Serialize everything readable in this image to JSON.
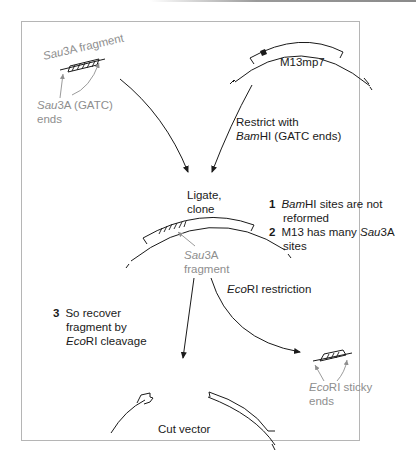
{
  "diagram": {
    "sau3a_fragment": {
      "label": "Sau3A fragment",
      "label_italic": "Sau",
      "label_rest": "3A fragment",
      "ends_label_italic": "Sau",
      "ends_label_rest": "3A (GATC)",
      "ends_label_line2": "ends"
    },
    "vector": {
      "label": "M13mp7"
    },
    "restrict_step": {
      "line1": "Restrict with",
      "line2_italic": "Bam",
      "line2_rest": "HI (GATC ends)"
    },
    "ligate_step": {
      "line1": "Ligate,",
      "line2": "clone"
    },
    "notes": [
      {
        "number": "1",
        "italic": "Bam",
        "text": "HI sites are not",
        "line2": "reformed"
      },
      {
        "number": "2",
        "text": "M13 has many ",
        "italic": "Sau",
        "text_after": "3A",
        "line2": "sites"
      },
      {
        "number": "3",
        "text": "So recover",
        "line2": "fragment by",
        "line3_italic": "Eco",
        "line3_rest": "RI cleavage"
      }
    ],
    "recombinant_fragment": {
      "italic": "Sau",
      "rest": "3A",
      "line2": "fragment"
    },
    "ecori_step": {
      "italic": "Eco",
      "rest": "RI restriction"
    },
    "sticky_ends": {
      "italic": "Eco",
      "rest": "RI sticky",
      "line2": "ends"
    },
    "cut_vector": {
      "label": "Cut vector"
    }
  },
  "colors": {
    "line": "#1a1a1a",
    "grey_label": "#8e8e8e",
    "frame": "#b5b5b5"
  }
}
